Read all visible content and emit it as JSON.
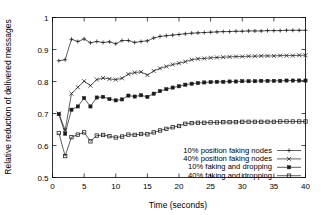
{
  "chart_data": {
    "type": "line",
    "title": "",
    "xlabel": "Time (seconds)",
    "ylabel": "Relative reduction of delivered messages",
    "xlim": [
      0,
      40
    ],
    "ylim": [
      0.5,
      1
    ],
    "xticks": [
      0,
      5,
      10,
      15,
      20,
      25,
      30,
      35,
      40
    ],
    "xtick_labels": [
      "0",
      "5",
      "10",
      "15",
      "20",
      "25",
      "30",
      "35",
      "40"
    ],
    "yticks": [
      0.5,
      0.6,
      0.7,
      0.8,
      0.9,
      1
    ],
    "ytick_labels": [
      "0.5",
      "0.6",
      "0.7",
      "0.8",
      "0.9",
      "1"
    ],
    "grid": false,
    "legend_position": "lower right",
    "x": [
      1,
      2,
      3,
      4,
      5,
      6,
      7,
      8,
      9,
      10,
      11,
      12,
      13,
      14,
      15,
      16,
      17,
      18,
      19,
      20,
      21,
      22,
      23,
      24,
      25,
      26,
      27,
      28,
      29,
      30,
      31,
      32,
      33,
      34,
      35,
      36,
      37,
      38,
      39,
      40
    ],
    "series": [
      {
        "name": "10% position faking nodes",
        "marker": "plus",
        "values": [
          0.865,
          0.868,
          0.932,
          0.925,
          0.933,
          0.921,
          0.925,
          0.922,
          0.924,
          0.918,
          0.928,
          0.928,
          0.922,
          0.925,
          0.927,
          0.936,
          0.941,
          0.943,
          0.945,
          0.947,
          0.949,
          0.951,
          0.952,
          0.953,
          0.954,
          0.955,
          0.956,
          0.956,
          0.957,
          0.957,
          0.958,
          0.958,
          0.958,
          0.959,
          0.959,
          0.959,
          0.96,
          0.96,
          0.96,
          0.96
        ]
      },
      {
        "name": "40% position faking nodes",
        "marker": "cross",
        "values": [
          0.7,
          0.648,
          0.762,
          0.782,
          0.801,
          0.787,
          0.806,
          0.811,
          0.808,
          0.806,
          0.81,
          0.823,
          0.828,
          0.83,
          0.82,
          0.833,
          0.841,
          0.847,
          0.853,
          0.857,
          0.862,
          0.868,
          0.871,
          0.872,
          0.874,
          0.875,
          0.876,
          0.877,
          0.878,
          0.878,
          0.879,
          0.879,
          0.88,
          0.88,
          0.88,
          0.881,
          0.881,
          0.881,
          0.882,
          0.882
        ]
      },
      {
        "name": "10% faking and dropping",
        "marker": "filled-square",
        "values": [
          0.698,
          0.637,
          0.712,
          0.722,
          0.748,
          0.722,
          0.75,
          0.752,
          0.745,
          0.741,
          0.744,
          0.756,
          0.753,
          0.757,
          0.752,
          0.762,
          0.77,
          0.776,
          0.781,
          0.785,
          0.79,
          0.793,
          0.795,
          0.797,
          0.798,
          0.799,
          0.799,
          0.8,
          0.8,
          0.801,
          0.801,
          0.801,
          0.802,
          0.802,
          0.802,
          0.802,
          0.803,
          0.803,
          0.803,
          0.803
        ]
      },
      {
        "name": "40% faking and dropping",
        "marker": "open-square",
        "values": [
          0.639,
          0.567,
          0.626,
          0.634,
          0.641,
          0.613,
          0.631,
          0.633,
          0.629,
          0.625,
          0.628,
          0.634,
          0.633,
          0.636,
          0.635,
          0.641,
          0.647,
          0.652,
          0.657,
          0.661,
          0.668,
          0.67,
          0.671,
          0.671,
          0.672,
          0.672,
          0.673,
          0.673,
          0.673,
          0.674,
          0.674,
          0.674,
          0.674,
          0.674,
          0.674,
          0.675,
          0.675,
          0.675,
          0.675,
          0.675
        ]
      }
    ]
  },
  "legend": {
    "items": [
      {
        "label": "10% position faking nodes"
      },
      {
        "label": "40% position faking nodes"
      },
      {
        "label": "10% faking and dropping"
      },
      {
        "label": "40% faking and dropping"
      }
    ]
  },
  "colors": {
    "ink": "#1a1a1a",
    "background": "#ffffff"
  }
}
